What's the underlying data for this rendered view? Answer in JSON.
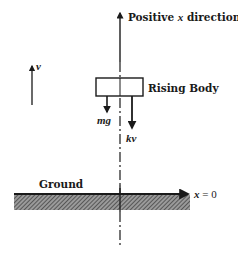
{
  "diagram": {
    "axis": {
      "label_prefix": "Positive ",
      "label_var": "x",
      "label_suffix": " direction"
    },
    "body": {
      "label": "Rising Body"
    },
    "forces": [
      {
        "name": "gravity",
        "label": "mg"
      },
      {
        "name": "drag",
        "label": "kv"
      }
    ],
    "velocity": {
      "label": "v"
    },
    "ground": {
      "label": "Ground",
      "origin_var": "x",
      "origin_eq": " = 0"
    },
    "colors": {
      "ink": "#1a1a1a",
      "hatch": "#555555",
      "background": "#ffffff"
    }
  }
}
